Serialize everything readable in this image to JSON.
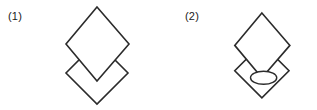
{
  "canvas": {
    "width": 317,
    "height": 110,
    "background_color": "#ffffff"
  },
  "style": {
    "stroke_color": "#2b2b2b",
    "fill_color": "#ffffff",
    "stroke_width": 1.6,
    "label_color": "#1a1a1a"
  },
  "figures": [
    {
      "id": "figure-1",
      "label": "(1)",
      "description": "Two overlapping diamonds",
      "shapes": [
        {
          "name": "lower-diamond",
          "type": "diamond",
          "points": "97,42 128,73 97,104 66,73"
        },
        {
          "name": "upper-diamond",
          "type": "diamond",
          "points": "97,7 129,44 97,81 66,44"
        }
      ],
      "ellipse": null
    },
    {
      "id": "figure-2",
      "label": "(2)",
      "description": "Two overlapping diamonds with an ellipse inside the lower diamond",
      "shapes": [
        {
          "name": "lower-diamond",
          "type": "diamond",
          "points": "97,42 128,73 97,104 66,73"
        },
        {
          "name": "upper-diamond",
          "type": "diamond",
          "points": "97,7 129,44 97,81 66,44"
        }
      ],
      "ellipse": {
        "name": "inner-ellipse",
        "type": "ellipse",
        "cx": 99,
        "cy": 81,
        "rx": 15,
        "ry": 7.5
      }
    }
  ]
}
